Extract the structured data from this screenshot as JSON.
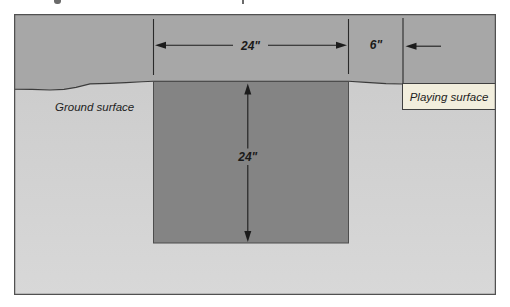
{
  "figure": {
    "type": "cross-section-diagram",
    "labels": {
      "ground_surface": "Ground surface",
      "playing_surface": "Playing surface"
    },
    "dimensions": {
      "pit_width": "24\"",
      "pit_depth": "24\"",
      "surface_offset": "6\""
    },
    "colors": {
      "above_ground_band": "#a7a7a7",
      "below_ground_top": "#c9c9c9",
      "below_ground_bottom": "#d8d8d8",
      "pit_fill": "#848484",
      "playing_surface_box": "#f2eedd",
      "frame_border": "#515151",
      "line": "#1c1c1c"
    }
  }
}
